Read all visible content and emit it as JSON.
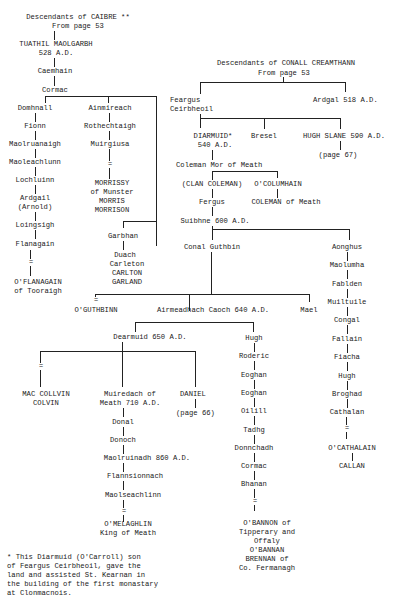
{
  "caibre": {
    "header": "Descendants of CAIBRE **",
    "from": "From page 53",
    "root": [
      "TUATHIL MAOLGARBH",
      "528 A.D."
    ],
    "caemhain": "Caemhain",
    "cormac": "Cormac",
    "domhnall_line": [
      "Domhnall",
      "Fionn",
      "Maolruanaigh",
      "Maoleachlunn",
      "Lochluinn",
      "Ardgail",
      "(Arnold)",
      "Loingsigh",
      "Flanagain"
    ],
    "oflanagain": [
      "O'FLANAGAIN",
      "of Tooraigh"
    ],
    "ainmireach_line": [
      "Ainmireach",
      "Rothechtaigh",
      "Muirgiusa"
    ],
    "morrissy": [
      "MORRISSY",
      "of Munster",
      "MORRIS",
      "MORRISON"
    ],
    "garbhan": "Garbhan",
    "duach": [
      "Duach",
      "Carleton",
      "CARLTON",
      "GARLAND"
    ],
    "equals": "="
  },
  "conall": {
    "header": "Descendants of CONALL CREAMTHANN",
    "from": "From page 53",
    "feargus": [
      "Feargus",
      "Ceirbheoil"
    ],
    "ardgal": "Ardgal 518 A.D.",
    "diarmuid": [
      "DIARMUID*",
      "540 A.D."
    ],
    "bresel": "Bresel",
    "hugh_slane": "HUGH SLANE 590 A.D.",
    "page67": "(page 67)",
    "coleman": "Coleman Mor of Meath",
    "clan_coleman": "(CLAN COLEMAN)",
    "ocolumhain": "O'COLUMHAIN",
    "coleman_meath": "COLEMAN of Meath",
    "fergus": "Fergus",
    "suibhne": "Suibhne 600 A.D.",
    "conal_guthbin": "Conal Guthbin",
    "aonghus_line": [
      "Aonghus",
      "Maolumha",
      "Fablden",
      "Muiltuile",
      "Congal",
      "Fallain",
      "Fiacha",
      "Hugh",
      "Broghad",
      "Cathalan"
    ],
    "ocathalain": "O'CATHALAIN",
    "callan": "CALLAN",
    "oguthbinn": "O'GUTHBINN",
    "airmeadhach": "Airmeadhach Caoch 640 A.D.",
    "mael": "Mael",
    "dearmuid": "Dearmuid 650 A.D.",
    "mac_collvin": [
      "MAC COLLVIN",
      "COLVIN"
    ],
    "muiredach": [
      "Muiredach of",
      "Meath 710 A.D."
    ],
    "daniel": "DANIEL",
    "page66": "(page 66)",
    "muiredach_line": [
      "Donal",
      "Donoch",
      "Maolruinadh 860 A.D.",
      "Flannsionnach",
      "Maolseachlinn"
    ],
    "omelaghlin": [
      "O'MELAGHLIN",
      "King of Meath"
    ],
    "hugh_line": [
      "Hugh",
      "Roderic",
      "Eoghan",
      "Eoghan",
      "Oilill",
      "Tadhg",
      "Donnchadh",
      "Cormac",
      "Bhanan"
    ],
    "obannon": [
      "O'BANNON of",
      "Tipperary and",
      "Offaly",
      "O'BANNAN",
      "BRENNAN of",
      "Co. Fermanagh"
    ]
  },
  "footnote": [
    "* This Diarmuid (O'Carroll) son",
    "of Feargus Ceirbheoil, gave the",
    "land and assisted St. Kearnan in",
    "the building of the first monastary",
    "at Clonmacnois."
  ]
}
